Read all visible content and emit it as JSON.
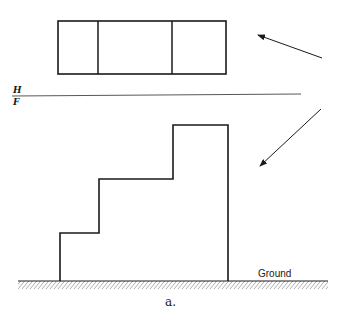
{
  "diagram": {
    "type": "orthographic projection",
    "plane_labels": {
      "top": "H",
      "bottom": "F"
    },
    "ground_label": "Ground",
    "caption": "a.",
    "top_view": {
      "partitions": 3
    },
    "front_view": {
      "shape": "stepped profile",
      "steps": 3
    },
    "arrows": [
      {
        "name": "top-view-direction",
        "points_to": "top view"
      },
      {
        "name": "front-view-direction",
        "points_to": "front view"
      }
    ],
    "colors": {
      "line": "#1a1a1a",
      "background": "#ffffff"
    }
  }
}
